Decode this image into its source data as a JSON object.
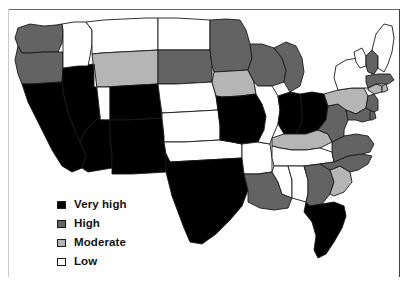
{
  "figure": {
    "type": "choropleth-map",
    "region": "United States (contiguous 48 states)",
    "width": 408,
    "height": 285
  },
  "legend": {
    "title": "",
    "items": [
      {
        "label": "Very high",
        "color": "#000000",
        "key": "very_high"
      },
      {
        "label": "High",
        "color": "#636363",
        "key": "high"
      },
      {
        "label": "Moderate",
        "color": "#b5b5b5",
        "key": "moderate"
      },
      {
        "label": "Low",
        "color": "#ffffff",
        "key": "low"
      }
    ]
  },
  "chart_data": {
    "type": "heatmap",
    "title": "",
    "xlabel": "",
    "ylabel": "",
    "categories": [
      "Very high",
      "High",
      "Moderate",
      "Low"
    ],
    "category_colors": [
      "#000000",
      "#636363",
      "#b5b5b5",
      "#ffffff"
    ],
    "legend_position": "bottom-left",
    "grid": false,
    "values": [
      10,
      16,
      7,
      15
    ],
    "states": [
      {
        "code": "WA",
        "name": "Washington",
        "level": "High"
      },
      {
        "code": "OR",
        "name": "Oregon",
        "level": "High"
      },
      {
        "code": "CA",
        "name": "California",
        "level": "Very high"
      },
      {
        "code": "NV",
        "name": "Nevada",
        "level": "Very high"
      },
      {
        "code": "ID",
        "name": "Idaho",
        "level": "Low"
      },
      {
        "code": "MT",
        "name": "Montana",
        "level": "Low"
      },
      {
        "code": "WY",
        "name": "Wyoming",
        "level": "Moderate"
      },
      {
        "code": "UT",
        "name": "Utah",
        "level": "Low"
      },
      {
        "code": "AZ",
        "name": "Arizona",
        "level": "Very high"
      },
      {
        "code": "CO",
        "name": "Colorado",
        "level": "Very high"
      },
      {
        "code": "NM",
        "name": "New Mexico",
        "level": "Very high"
      },
      {
        "code": "ND",
        "name": "North Dakota",
        "level": "Low"
      },
      {
        "code": "SD",
        "name": "South Dakota",
        "level": "High"
      },
      {
        "code": "NE",
        "name": "Nebraska",
        "level": "Low"
      },
      {
        "code": "KS",
        "name": "Kansas",
        "level": "Low"
      },
      {
        "code": "OK",
        "name": "Oklahoma",
        "level": "Low"
      },
      {
        "code": "TX",
        "name": "Texas",
        "level": "Very high"
      },
      {
        "code": "MN",
        "name": "Minnesota",
        "level": "High"
      },
      {
        "code": "IA",
        "name": "Iowa",
        "level": "Moderate"
      },
      {
        "code": "MO",
        "name": "Missouri",
        "level": "Very high"
      },
      {
        "code": "AR",
        "name": "Arkansas",
        "level": "Low"
      },
      {
        "code": "LA",
        "name": "Louisiana",
        "level": "High"
      },
      {
        "code": "WI",
        "name": "Wisconsin",
        "level": "High"
      },
      {
        "code": "IL",
        "name": "Illinois",
        "level": "Low"
      },
      {
        "code": "MI",
        "name": "Michigan",
        "level": "High"
      },
      {
        "code": "IN",
        "name": "Indiana",
        "level": "Very high"
      },
      {
        "code": "OH",
        "name": "Ohio",
        "level": "Very high"
      },
      {
        "code": "KY",
        "name": "Kentucky",
        "level": "Moderate"
      },
      {
        "code": "TN",
        "name": "Tennessee",
        "level": "Low"
      },
      {
        "code": "MS",
        "name": "Mississippi",
        "level": "Low"
      },
      {
        "code": "AL",
        "name": "Alabama",
        "level": "Low"
      },
      {
        "code": "GA",
        "name": "Georgia",
        "level": "High"
      },
      {
        "code": "FL",
        "name": "Florida",
        "level": "Very high"
      },
      {
        "code": "SC",
        "name": "South Carolina",
        "level": "Moderate"
      },
      {
        "code": "NC",
        "name": "North Carolina",
        "level": "High"
      },
      {
        "code": "VA",
        "name": "Virginia",
        "level": "High"
      },
      {
        "code": "WV",
        "name": "West Virginia",
        "level": "High"
      },
      {
        "code": "PA",
        "name": "Pennsylvania",
        "level": "Moderate"
      },
      {
        "code": "MD",
        "name": "Maryland",
        "level": "High"
      },
      {
        "code": "DE",
        "name": "Delaware",
        "level": "High"
      },
      {
        "code": "NJ",
        "name": "New Jersey",
        "level": "High"
      },
      {
        "code": "NY",
        "name": "New York",
        "level": "Low"
      },
      {
        "code": "CT",
        "name": "Connecticut",
        "level": "Moderate"
      },
      {
        "code": "RI",
        "name": "Rhode Island",
        "level": "Moderate"
      },
      {
        "code": "MA",
        "name": "Massachusetts",
        "level": "High"
      },
      {
        "code": "VT",
        "name": "Vermont",
        "level": "Low"
      },
      {
        "code": "NH",
        "name": "New Hampshire",
        "level": "High"
      },
      {
        "code": "ME",
        "name": "Maine",
        "level": "Low"
      }
    ]
  },
  "geometry": {
    "WA": "M 18,28 L 30,24 L 44,26 L 56,25 L 62,24 L 63,30 L 62,43 L 58,52 L 44,52 L 30,53 L 22,53 L 18,46 L 15,38 Z",
    "OR": "M 18,46 L 22,53 L 30,53 L 44,52 L 58,52 L 63,52 L 63,68 L 62,82 L 46,83 L 32,84 L 22,84 L 18,74 L 15,60 Z",
    "CA": "M 22,84 L 32,84 L 46,83 L 62,82 L 64,96 L 68,112 L 74,128 L 80,142 L 86,156 L 82,168 L 72,172 L 62,166 L 52,150 L 44,134 L 36,118 L 28,102 Z",
    "NV": "M 62,82 L 63,68 L 78,66 L 94,64 L 96,80 L 98,98 L 100,116 L 86,130 L 80,142 L 74,128 L 68,112 L 64,96 Z",
    "ID": "M 63,30 L 62,24 L 74,22 L 86,22 L 92,30 L 92,44 L 90,56 L 88,66 L 78,66 L 63,68 L 63,52 L 63,43 Z",
    "MT": "M 86,22 L 104,20 L 124,19 L 146,18 L 158,18 L 158,34 L 158,50 L 140,51 L 120,52 L 102,53 L 92,54 L 92,44 L 92,30 Z",
    "WY": "M 92,54 L 102,53 L 120,52 L 140,51 L 158,50 L 158,66 L 158,84 L 140,85 L 122,86 L 104,87 L 94,87 L 94,72 Z",
    "UT": "M 94,64 L 94,87 L 104,87 L 110,87 L 110,104 L 110,120 L 100,120 L 100,116 L 98,98 L 96,80 Z",
    "AZ": "M 100,116 L 100,120 L 110,120 L 110,136 L 112,154 L 112,168 L 100,170 L 88,172 L 82,168 L 86,156 L 80,142 L 86,130 Z",
    "CO": "M 110,87 L 122,86 L 140,85 L 158,84 L 160,100 L 162,118 L 146,119 L 128,120 L 110,120 L 110,104 Z",
    "NM": "M 110,120 L 128,120 L 146,119 L 162,118 L 164,136 L 166,154 L 166,172 L 150,173 L 132,174 L 112,174 L 112,168 L 112,154 L 110,136 Z",
    "ND": "M 158,18 L 176,18 L 194,19 L 210,20 L 210,36 L 210,50 L 192,50 L 174,50 L 158,50 L 158,34 Z",
    "SD": "M 158,50 L 174,50 L 192,50 L 210,50 L 212,66 L 212,82 L 194,83 L 176,84 L 158,84 L 158,66 Z",
    "NE": "M 158,84 L 176,84 L 194,83 L 212,82 L 216,96 L 218,110 L 200,111 L 182,112 L 162,113 L 160,100 Z",
    "KS": "M 162,113 L 182,112 L 200,111 L 218,110 L 220,126 L 220,140 L 202,141 L 184,142 L 164,142 L 164,136 L 162,118 Z",
    "OK": "M 164,142 L 184,142 L 202,141 L 220,140 L 232,142 L 242,144 L 242,158 L 224,159 L 206,160 L 188,161 L 170,162 L 166,154 Z",
    "TX": "M 166,154 L 170,162 L 188,161 L 206,160 L 224,159 L 242,158 L 244,174 L 248,190 L 242,206 L 230,220 L 216,234 L 202,244 L 190,242 L 184,228 L 178,212 L 172,196 L 168,180 L 166,172 Z",
    "MN": "M 210,20 L 226,19 L 240,20 L 246,30 L 250,44 L 252,58 L 248,70 L 232,71 L 214,72 L 212,66 L 210,50 L 210,36 Z",
    "IA": "M 212,82 L 214,72 L 232,71 L 248,70 L 254,82 L 256,94 L 240,96 L 222,97 L 216,96 Z",
    "MO": "M 216,96 L 222,97 L 240,96 L 256,94 L 262,104 L 266,116 L 264,130 L 258,142 L 242,144 L 232,142 L 220,140 L 220,126 L 218,110 Z",
    "AR": "M 242,144 L 258,142 L 270,144 L 272,158 L 272,172 L 258,174 L 244,174 L 242,158 Z",
    "LA": "M 244,174 L 258,174 L 272,172 L 278,182 L 282,194 L 292,198 L 288,208 L 274,210 L 260,208 L 248,202 L 248,190 L 244,174 Z",
    "WI": "M 252,58 L 250,44 L 262,44 L 274,48 L 282,58 L 286,70 L 284,82 L 272,86 L 258,86 L 254,82 L 248,70 Z",
    "IL": "M 256,94 L 254,82 L 258,86 L 272,86 L 278,96 L 280,110 L 278,124 L 272,138 L 270,144 L 258,142 L 264,130 L 266,116 L 262,104 Z",
    "MI": "M 274,48 L 286,42 L 296,46 L 302,58 L 304,72 L 300,86 L 290,92 L 284,82 L 286,70 L 282,58 Z",
    "IN": "M 278,96 L 290,92 L 300,94 L 302,108 L 302,122 L 296,134 L 284,134 L 278,124 L 280,110 Z",
    "OH": "M 300,94 L 312,92 L 324,94 L 328,106 L 326,120 L 318,130 L 306,134 L 296,134 L 302,122 L 302,108 Z",
    "KY": "M 284,134 L 296,134 L 306,134 L 318,130 L 328,134 L 332,142 L 320,148 L 306,150 L 292,150 L 280,148 L 272,146 L 272,138 Z",
    "TN": "M 272,146 L 280,148 L 292,150 L 306,150 L 320,148 L 332,152 L 334,162 L 320,164 L 304,166 L 288,166 L 274,166 L 272,158 Z",
    "MS": "M 274,166 L 288,166 L 292,180 L 292,194 L 292,198 L 282,194 L 278,182 L 272,172 Z",
    "AL": "M 288,166 L 304,166 L 308,180 L 308,194 L 306,202 L 292,198 L 292,194 L 292,180 Z",
    "GA": "M 304,166 L 320,164 L 330,170 L 334,182 L 330,194 L 322,204 L 310,206 L 306,202 L 308,194 L 308,180 Z",
    "FL": "M 306,202 L 310,206 L 322,204 L 334,202 L 344,206 L 346,216 L 342,228 L 334,242 L 326,254 L 318,258 L 314,250 L 316,236 L 312,222 L 304,212 Z",
    "SC": "M 330,170 L 340,166 L 350,172 L 352,182 L 344,192 L 334,196 L 330,194 L 334,182 Z",
    "NC": "M 334,162 L 348,156 L 362,154 L 372,156 L 368,164 L 358,170 L 350,172 L 340,166 L 330,170 L 320,164 Z",
    "VA": "M 332,142 L 344,136 L 356,134 L 368,136 L 374,144 L 370,152 L 362,154 L 348,156 L 334,162 L 332,152 Z",
    "WV": "M 328,106 L 338,104 L 346,110 L 348,120 L 344,130 L 344,136 L 332,142 L 328,134 L 318,130 L 326,120 Z",
    "PA": "M 324,94 L 338,90 L 352,88 L 364,88 L 368,96 L 366,108 L 356,114 L 346,110 L 338,104 L 328,106 Z",
    "MD": "M 356,114 L 366,108 L 372,112 L 370,120 L 362,122 L 356,120 L 348,120 L 346,110 Z",
    "DE": "M 370,112 L 374,110 L 376,118 L 372,120 L 370,120 Z",
    "NJ": "M 368,96 L 374,94 L 378,100 L 378,110 L 374,112 L 370,110 L 366,108 Z",
    "NY": "M 338,90 L 334,78 L 336,66 L 346,60 L 358,58 L 366,62 L 370,70 L 374,80 L 368,88 L 356,88 L 352,88 Z",
    "CT": "M 368,88 L 376,84 L 382,86 L 382,92 L 374,94 L 368,90 Z",
    "RI": "M 382,86 L 386,84 L 388,90 L 384,92 L 382,92 Z",
    "MA": "M 366,76 L 378,74 L 390,74 L 394,80 L 388,84 L 376,84 L 368,88 L 366,82 Z",
    "VT": "M 354,52 L 362,48 L 366,56 L 366,66 L 360,68 L 356,62 Z",
    "NH": "M 366,56 L 372,50 L 378,56 L 378,68 L 374,74 L 368,72 L 366,66 Z",
    "ME": "M 372,50 L 376,34 L 384,24 L 392,26 L 394,38 L 392,52 L 388,64 L 384,72 L 378,68 L 378,56 Z"
  }
}
